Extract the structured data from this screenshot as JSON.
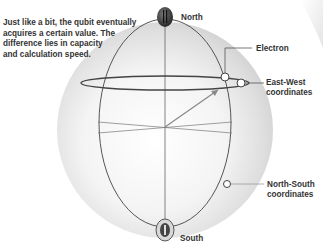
{
  "caption": {
    "lines": [
      "Just like a bit, the qubit eventually",
      "acquires a certain value. The",
      "difference lies in capacity",
      " and calculation speed."
    ]
  },
  "labels": {
    "north": "North",
    "south": "South",
    "electron": "Electron",
    "east_west_1": "East-West",
    "east_west_2": "coordinates",
    "north_south_1": "North-South",
    "north_south_2": "coordinates"
  },
  "colors": {
    "text": "#333333",
    "line": "#555555",
    "sphere_highlight": "#ffffff",
    "sphere_shadow": "#c8c8c8",
    "pole": "#3a3a3a"
  }
}
